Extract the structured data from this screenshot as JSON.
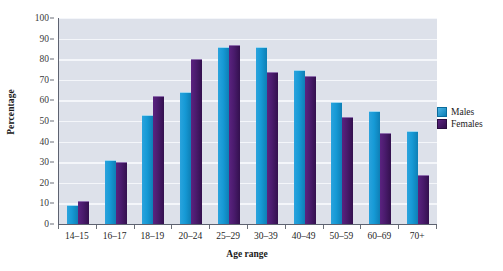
{
  "chart_data": {
    "type": "bar",
    "title": "",
    "xlabel": "Age range",
    "ylabel": "Percentage",
    "categories": [
      "14–15",
      "16–17",
      "18–19",
      "20–24",
      "25–29",
      "30–39",
      "40–49",
      "50–59",
      "60–69",
      "70+"
    ],
    "series": [
      {
        "name": "Males",
        "color": "#169ad6",
        "values": [
          9,
          31,
          53,
          64,
          86,
          86,
          75,
          59,
          55,
          45
        ]
      },
      {
        "name": "Females",
        "color": "#4a1b6d",
        "values": [
          11,
          30,
          62,
          80,
          87,
          74,
          72,
          52,
          44,
          24
        ]
      }
    ],
    "ylim": [
      0,
      100
    ],
    "ytick_values": [
      0,
      10,
      20,
      30,
      40,
      50,
      60,
      70,
      80,
      90,
      100
    ],
    "ytick_labels": [
      "0",
      "10",
      "20",
      "30",
      "40",
      "50",
      "60",
      "70",
      "80",
      "90",
      "100"
    ],
    "grid": true,
    "legend_position": "right",
    "plot_background": "#dde1ea",
    "gridline_color": "#f4f6fa",
    "axis_color": "#5d6270"
  },
  "legend": {
    "items": [
      {
        "label": "Males",
        "swatch": "males-swatch"
      },
      {
        "label": "Females",
        "swatch": "females-swatch"
      }
    ]
  }
}
